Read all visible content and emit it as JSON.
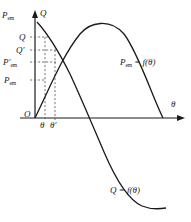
{
  "figure": {
    "background": "#ffffff",
    "ink": "#1a1a1a",
    "guide_color": "#555555"
  },
  "axes": {
    "y_left_label": "P",
    "y_left_sub": "em",
    "y_right_label": "Q",
    "x_label": "θ",
    "origin_label": "O",
    "x_axis_y": 118,
    "y_axis_x": 35,
    "x_axis_end": 185,
    "y_axis_top": 12
  },
  "y_ticks": [
    {
      "name": "Q",
      "label": "Q",
      "prime": "",
      "sub": "",
      "y": 37
    },
    {
      "name": "Q'",
      "label": "Q",
      "prime": "′",
      "sub": "",
      "y": 50
    },
    {
      "name": "P'em",
      "label": "P",
      "prime": "′",
      "sub": "em",
      "y": 62
    },
    {
      "name": "Pem",
      "label": "P",
      "prime": "",
      "sub": "em",
      "y": 80
    }
  ],
  "x_ticks": [
    {
      "name": "theta",
      "label": "θ",
      "prime": "",
      "x": 44
    },
    {
      "name": "theta'",
      "label": "θ",
      "prime": "′",
      "x": 54
    }
  ],
  "curves": [
    {
      "name": "pem-curve",
      "label": "P",
      "label_sub": "em",
      "label_rest": " = f(θ)",
      "path": "M 35 118 C 48 92, 62 56, 80 34 C 90 22, 110 18, 124 34 C 138 52, 152 96, 163 118"
    },
    {
      "name": "q-curve",
      "label": "Q",
      "label_sub": "",
      "label_rest": " = f(θ)",
      "path": "M 37 22 C 48 34, 58 50, 70 74 C 82 100, 92 124, 104 152 C 116 180, 128 200, 142 206 C 152 210, 160 209, 166 208"
    }
  ],
  "guides": {
    "horizontal": [
      {
        "name": "guide-q",
        "y": 37,
        "x1": 30,
        "x2": 48
      },
      {
        "name": "guide-qp",
        "y": 50,
        "x1": 30,
        "x2": 56
      },
      {
        "name": "guide-pemp",
        "y": 62,
        "x1": 30,
        "x2": 56
      },
      {
        "name": "guide-pem",
        "y": 80,
        "x1": 30,
        "x2": 46
      }
    ],
    "vertical": [
      {
        "name": "guide-theta",
        "x": 45,
        "y1": 37,
        "y2": 120
      },
      {
        "name": "guide-thetap",
        "x": 55,
        "y1": 50,
        "y2": 120
      }
    ]
  }
}
